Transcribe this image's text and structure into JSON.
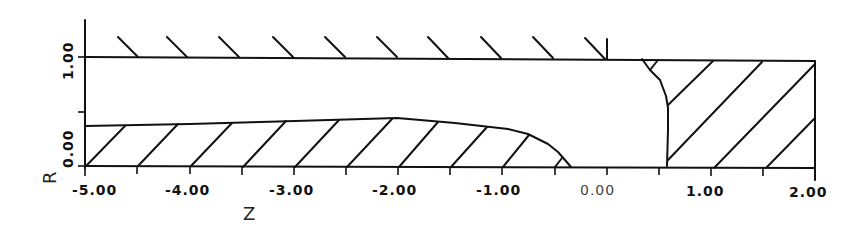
{
  "figure": {
    "type": "axisymmetric-geometry-diagram",
    "x_axis": {
      "title": "Z",
      "range": [
        -5.0,
        2.0
      ],
      "tick_step": 0.5,
      "labels": [
        "-5.00",
        "-4.00",
        "-3.00",
        "-2.00",
        "-1.00",
        "0.00",
        "1.00",
        "2.00"
      ]
    },
    "y_axis": {
      "title": "R",
      "range": [
        0.0,
        1.0
      ],
      "labels": [
        "0.00",
        "1.00"
      ]
    },
    "regions": [
      {
        "name": "upper-wall",
        "description": "Hatched wall at R = 1.00 from Z = -5.00 to Z = 0.00"
      },
      {
        "name": "lower-body",
        "description": "Hatched body from R = 0 to R ≈ 0.37–0.43, Z = -5.00 to Z ≈ -0.37"
      },
      {
        "name": "right-body",
        "description": "Hatched block from Z ≈ 0.35–0.6 to Z = 2.00, R = 0 to 1.00"
      }
    ]
  }
}
